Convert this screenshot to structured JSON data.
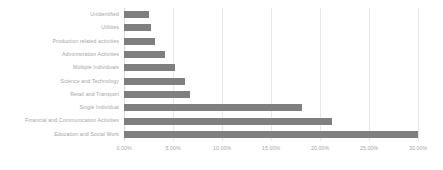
{
  "chart_data": {
    "type": "bar",
    "orientation": "horizontal",
    "title": "",
    "subtitle": "",
    "xlabel": "",
    "ylabel": "",
    "xlim": [
      0,
      30
    ],
    "x_tick_format": "percent-2dp",
    "grid": true,
    "grid_axis": "x",
    "legend": false,
    "legend_position": "none",
    "bar_color": "#7f7f7f",
    "text_color": "#a6a6a6",
    "gridline_color": "#e8e8e8",
    "background_color": "#ffffff",
    "categories": [
      "Unidentified",
      "Utilities",
      "Production related activities",
      "Administration Activities",
      "Multiple Individuals",
      "Science and Technology",
      "Retail and Transport",
      "Single Individual",
      "Financial and Communication Activities",
      "Education and Social Work"
    ],
    "values": [
      2.55,
      2.75,
      3.16,
      4.18,
      5.2,
      6.22,
      6.73,
      18.16,
      21.22,
      31.43
    ],
    "value_unit": "%",
    "x_ticks": [
      0,
      5,
      10,
      15,
      20,
      25,
      30
    ],
    "x_tick_labels": [
      "0.00%",
      "5.00%",
      "10.00%",
      "15.00%",
      "20.00%",
      "25.00%",
      "30.00%"
    ]
  }
}
